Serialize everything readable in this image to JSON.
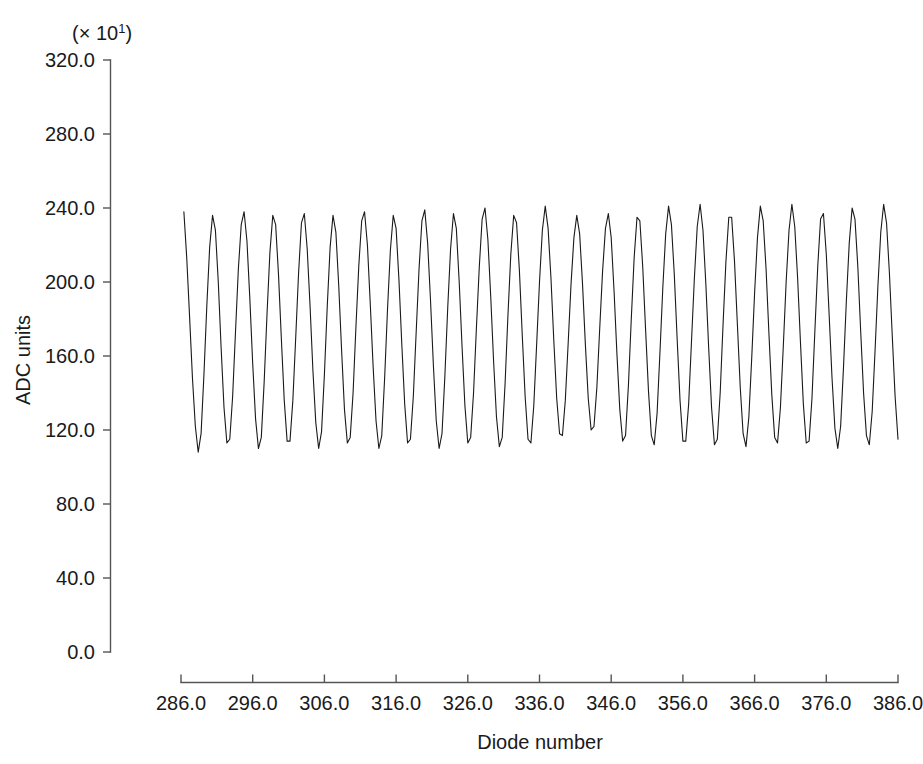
{
  "chart_data": {
    "type": "line",
    "title": "",
    "subtitle": "",
    "xlabel": "Diode number",
    "ylabel": "ADC units",
    "y_multiplier_label": "(× 10",
    "y_multiplier_exponent": "1",
    "y_multiplier_close": ")",
    "grid": false,
    "legend": null,
    "xlim": [
      286.0,
      386.0
    ],
    "ylim": [
      0.0,
      320.0
    ],
    "xticks": [
      "286.0",
      "296.0",
      "306.0",
      "316.0",
      "326.0",
      "336.0",
      "346.0",
      "356.0",
      "366.0",
      "376.0",
      "386.0"
    ],
    "xtick_values": [
      286,
      296,
      306,
      316,
      326,
      336,
      346,
      356,
      366,
      376,
      386
    ],
    "yticks": [
      "0.0",
      "40.0",
      "80.0",
      "120.0",
      "160.0",
      "200.0",
      "240.0",
      "280.0",
      "320.0"
    ],
    "ytick_values": [
      0,
      40,
      80,
      120,
      160,
      200,
      240,
      280,
      320
    ],
    "line_color": "#1a1a1a",
    "axis_color": "#555555",
    "background_color": "#ffffff",
    "x": [
      286.4,
      286.8,
      287.2,
      287.6,
      288.0,
      288.4,
      288.8,
      289.2,
      289.6,
      290.0,
      290.4,
      290.8,
      291.2,
      291.6,
      292.0,
      292.4,
      292.8,
      293.2,
      293.6,
      294.0,
      294.4,
      294.8,
      295.2,
      295.6,
      296.0,
      296.4,
      296.8,
      297.2,
      297.6,
      298.0,
      298.4,
      298.8,
      299.2,
      299.6,
      300.0,
      300.4,
      300.8,
      301.2,
      301.6,
      302.0,
      302.4,
      302.8,
      303.2,
      303.6,
      304.0,
      304.4,
      304.8,
      305.2,
      305.6,
      306.0,
      306.4,
      306.8,
      307.2,
      307.6,
      308.0,
      308.4,
      308.8,
      309.2,
      309.6,
      310.0,
      310.4,
      310.8,
      311.2,
      311.6,
      312.0,
      312.4,
      312.8,
      313.2,
      313.6,
      314.0,
      314.4,
      314.8,
      315.2,
      315.6,
      316.0,
      316.4,
      316.8,
      317.2,
      317.6,
      318.0,
      318.4,
      318.8,
      319.2,
      319.6,
      320.0,
      320.4,
      320.8,
      321.2,
      321.6,
      322.0,
      322.4,
      322.8,
      323.2,
      323.6,
      324.0,
      324.4,
      324.8,
      325.2,
      325.6,
      326.0,
      326.4,
      326.8,
      327.2,
      327.6,
      328.0,
      328.4,
      328.8,
      329.2,
      329.6,
      330.0,
      330.4,
      330.8,
      331.2,
      331.6,
      332.0,
      332.4,
      332.8,
      333.2,
      333.6,
      334.0,
      334.4,
      334.8,
      335.2,
      335.6,
      336.0,
      336.4,
      336.8,
      337.2,
      337.6,
      338.0,
      338.4,
      338.8,
      339.2,
      339.6,
      340.0,
      340.4,
      340.8,
      341.2,
      341.6,
      342.0,
      342.4,
      342.8,
      343.2,
      343.6,
      344.0,
      344.4,
      344.8,
      345.2,
      345.6,
      346.0,
      346.4,
      346.8,
      347.2,
      347.6,
      348.0,
      348.4,
      348.8,
      349.2,
      349.6,
      350.0,
      350.4,
      350.8,
      351.2,
      351.6,
      352.0,
      352.4,
      352.8,
      353.2,
      353.6,
      354.0,
      354.4,
      354.8,
      355.2,
      355.6,
      356.0,
      356.4,
      356.8,
      357.2,
      357.6,
      358.0,
      358.4,
      358.8,
      359.2,
      359.6,
      360.0,
      360.4,
      360.8,
      361.2,
      361.6,
      362.0,
      362.4,
      362.8,
      363.2,
      363.6,
      364.0,
      364.4,
      364.8,
      365.2,
      365.6,
      366.0,
      366.4,
      366.8,
      367.2,
      367.6,
      368.0,
      368.4,
      368.8,
      369.2,
      369.6,
      370.0,
      370.4,
      370.8,
      371.2,
      371.6,
      372.0,
      372.4,
      372.8,
      373.2,
      373.6,
      374.0,
      374.4,
      374.8,
      375.2,
      375.6,
      376.0,
      376.4,
      376.8,
      377.2,
      377.6,
      378.0,
      378.4,
      378.8,
      379.2,
      379.6,
      380.0,
      380.4,
      380.8,
      381.2,
      381.6,
      382.0,
      382.4,
      382.8,
      383.2,
      383.6,
      384.0,
      384.4,
      384.8,
      385.2,
      385.6,
      386.0
    ],
    "y": [
      238,
      213,
      181,
      148,
      122,
      108,
      118,
      150,
      187,
      219,
      236,
      228,
      200,
      164,
      132,
      113,
      115,
      138,
      173,
      207,
      231,
      238,
      222,
      191,
      156,
      126,
      110,
      116,
      146,
      183,
      216,
      236,
      231,
      204,
      169,
      136,
      114,
      114,
      136,
      170,
      205,
      232,
      237,
      218,
      187,
      152,
      124,
      110,
      119,
      150,
      187,
      219,
      236,
      227,
      198,
      163,
      131,
      113,
      116,
      140,
      176,
      209,
      233,
      238,
      220,
      188,
      154,
      125,
      110,
      117,
      148,
      185,
      217,
      236,
      229,
      201,
      166,
      134,
      113,
      115,
      138,
      173,
      207,
      233,
      239,
      221,
      190,
      155,
      125,
      110,
      118,
      149,
      186,
      218,
      237,
      229,
      200,
      165,
      133,
      113,
      116,
      140,
      175,
      208,
      234,
      240,
      223,
      192,
      157,
      127,
      111,
      116,
      145,
      182,
      215,
      236,
      232,
      206,
      171,
      138,
      115,
      113,
      133,
      166,
      200,
      228,
      241,
      229,
      202,
      168,
      137,
      118,
      117,
      136,
      167,
      199,
      224,
      236,
      226,
      199,
      166,
      137,
      120,
      122,
      143,
      175,
      206,
      229,
      237,
      224,
      195,
      161,
      131,
      114,
      117,
      144,
      180,
      213,
      235,
      233,
      208,
      174,
      141,
      117,
      112,
      129,
      162,
      197,
      226,
      241,
      231,
      204,
      169,
      136,
      114,
      114,
      134,
      168,
      202,
      230,
      242,
      228,
      199,
      164,
      132,
      112,
      115,
      140,
      177,
      211,
      235,
      235,
      211,
      177,
      143,
      118,
      111,
      127,
      159,
      194,
      224,
      241,
      233,
      207,
      172,
      139,
      116,
      113,
      132,
      165,
      200,
      228,
      242,
      230,
      202,
      167,
      134,
      113,
      114,
      137,
      173,
      208,
      234,
      237,
      215,
      182,
      148,
      121,
      110,
      122,
      154,
      190,
      221,
      240,
      234,
      208,
      173,
      140,
      117,
      112,
      130,
      163,
      198,
      227,
      242,
      232,
      205,
      171,
      138,
      115,
      113,
      134,
      168,
      203,
      231,
      243,
      229,
      200,
      165,
      133,
      112,
      115,
      139,
      176,
      211,
      236,
      236,
      213,
      180,
      146,
      120,
      110,
      124,
      156,
      192,
      223,
      241,
      232,
      205,
      170,
      137,
      148
    ]
  },
  "axis": {
    "y_exponent_prefix": "(× 10",
    "y_exponent_value": "1",
    "y_exponent_suffix": ")"
  }
}
